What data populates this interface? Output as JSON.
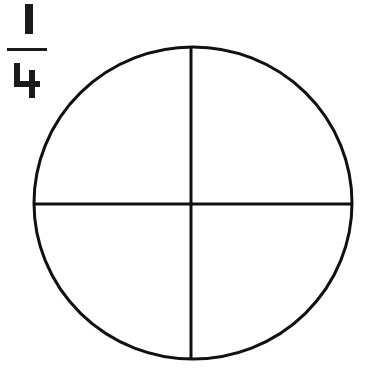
{
  "fraction": {
    "numerator": "1",
    "denominator": "4",
    "label": "1/4"
  },
  "circle": {
    "parts": 4,
    "description": "circle divided into four equal parts by a vertical and horizontal line",
    "stroke_color": "#111111",
    "fill_color": "#ffffff"
  }
}
